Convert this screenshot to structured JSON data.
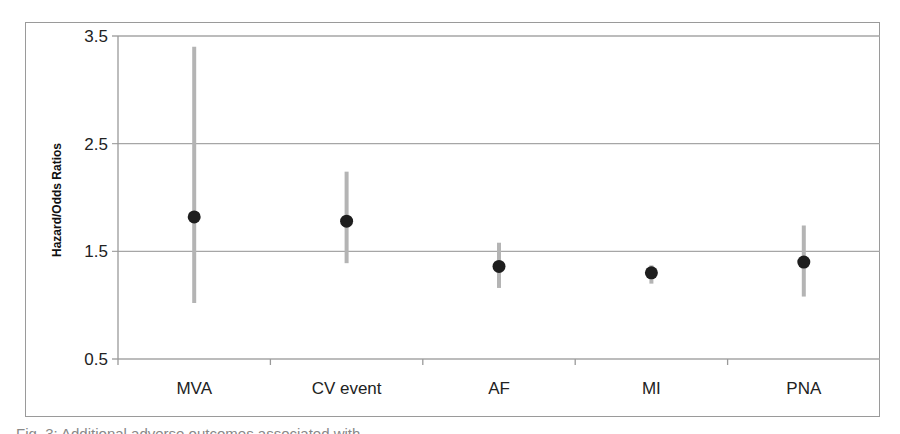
{
  "figure": {
    "caption": "Fig. 3: Additional adverse outcomes associated with ..."
  },
  "colors": {
    "grid": "#a6a6a6",
    "axis": "#9a9a9a",
    "error_bar": "#b4b4b4",
    "point": "#1e1e1e",
    "frame": "#9a9a9a"
  },
  "chart_data": {
    "type": "scatter",
    "subtype": "point_estimate_with_confidence_intervals",
    "title": "",
    "xlabel": "",
    "ylabel": "Hazard/Odds Ratios",
    "ylim": [
      0.5,
      3.5
    ],
    "yticks": [
      0.5,
      1.5,
      2.5,
      3.5
    ],
    "ytick_labels": [
      "0.5",
      "1.5",
      "2.5",
      "3.5"
    ],
    "grid": true,
    "legend": null,
    "categories": [
      "MVA",
      "CV event",
      "AF",
      "MI",
      "PNA"
    ],
    "series": [
      {
        "name": "Point estimate",
        "values": [
          1.82,
          1.78,
          1.36,
          1.3,
          1.4
        ]
      },
      {
        "name": "CI lower",
        "values": [
          1.02,
          1.39,
          1.16,
          1.2,
          1.08
        ]
      },
      {
        "name": "CI upper",
        "values": [
          3.4,
          2.24,
          1.58,
          1.37,
          1.74
        ]
      }
    ]
  }
}
